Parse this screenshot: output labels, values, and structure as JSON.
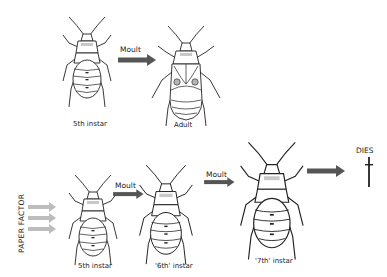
{
  "diagram": {
    "top_row": {
      "stages": [
        {
          "label": "5th instar"
        },
        {
          "label": "Adult"
        }
      ],
      "arrow_label": "Moult"
    },
    "bottom_row": {
      "side_label": "PAPER FACTOR",
      "stages": [
        {
          "label": "5th instar"
        },
        {
          "label": "'6th' instar"
        },
        {
          "label": "'7th' instar"
        }
      ],
      "arrow_labels": [
        "Moult",
        "Moult"
      ],
      "outcome_label": "DIES"
    },
    "colors": {
      "arrow_dark": "#555555",
      "arrow_light": "#bdbdbd",
      "line": "#222222",
      "pronotum_fill": "#c8c8c8"
    }
  }
}
